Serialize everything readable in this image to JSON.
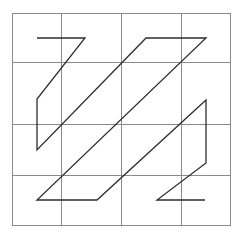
{
  "diagram": {
    "type": "line-path-on-grid",
    "background": "#ffffff",
    "grid": {
      "rows": 4,
      "cols": 4,
      "x_lines": [
        12,
        61,
        121,
        181,
        230
      ],
      "y_lines": [
        13,
        62,
        124,
        175,
        225
      ],
      "color": "#8a8a8a"
    },
    "path": {
      "color": "#2e2e2e",
      "points": [
        [
          37,
          38
        ],
        [
          85,
          38
        ],
        [
          37,
          99
        ],
        [
          37,
          150
        ],
        [
          146,
          38
        ],
        [
          206,
          38
        ],
        [
          37,
          200
        ],
        [
          97,
          200
        ],
        [
          206,
          100
        ],
        [
          206,
          163
        ],
        [
          157,
          200
        ],
        [
          205,
          200
        ]
      ]
    }
  }
}
